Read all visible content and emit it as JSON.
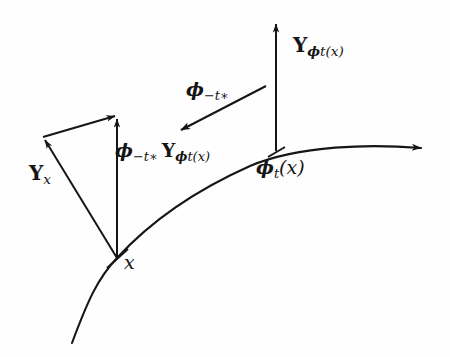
{
  "figure": {
    "background_color": "#fefefe",
    "stroke_color": "#151515"
  },
  "labels": {
    "vector_at_flowed_point": {
      "symbol": "Y",
      "subscript_phi": "ϕ",
      "subscript_rest": "t(x)",
      "plain": "Y_{ϕt(x)}"
    },
    "flowed_point": {
      "phi": "ϕ",
      "sub_t": "t",
      "arg": "(x)",
      "plain": "ϕ_t(x)"
    },
    "pullback_map": {
      "phi": "ϕ",
      "sub": "−t∗",
      "plain": "ϕ_{−t∗}"
    },
    "pushed_vector": {
      "phi": "ϕ",
      "sub": "−t∗",
      "symbol": "Y",
      "subscript_phi": "ϕ",
      "subscript_rest": "t(x)",
      "plain": "ϕ_{−t∗} Y_{ϕt(x)}"
    },
    "vector_at_base_point": {
      "symbol": "Y",
      "sub": "x",
      "plain": "Y_x"
    },
    "base_point": {
      "symbol": "x",
      "plain": "x"
    }
  },
  "geometry": {
    "integral_curve": {
      "name": "integral-curve",
      "path": "M 72 343 C 88 300 98 278 117 258 C 150 222 196 190 250 166 C 300 145 370 144 421 148",
      "has_arrowhead_at_end": true
    },
    "base_point_marker": {
      "x": 117,
      "y": 258
    },
    "vertical_arrow_left": {
      "x1": 117,
      "y1": 258,
      "x2": 117,
      "y2": 117
    },
    "vertical_arrow_right": {
      "x1": 276,
      "y1": 151,
      "x2": 276,
      "y2": 21
    },
    "vector_Yx_arrow": {
      "x1": 117,
      "y1": 258,
      "x2": 43,
      "y2": 137
    },
    "connector_arrow": {
      "x1": 43,
      "y1": 137,
      "x2": 117,
      "y2": 116
    },
    "pullback_arrow": {
      "x1": 266,
      "y1": 86,
      "x2": 178,
      "y2": 132
    }
  }
}
